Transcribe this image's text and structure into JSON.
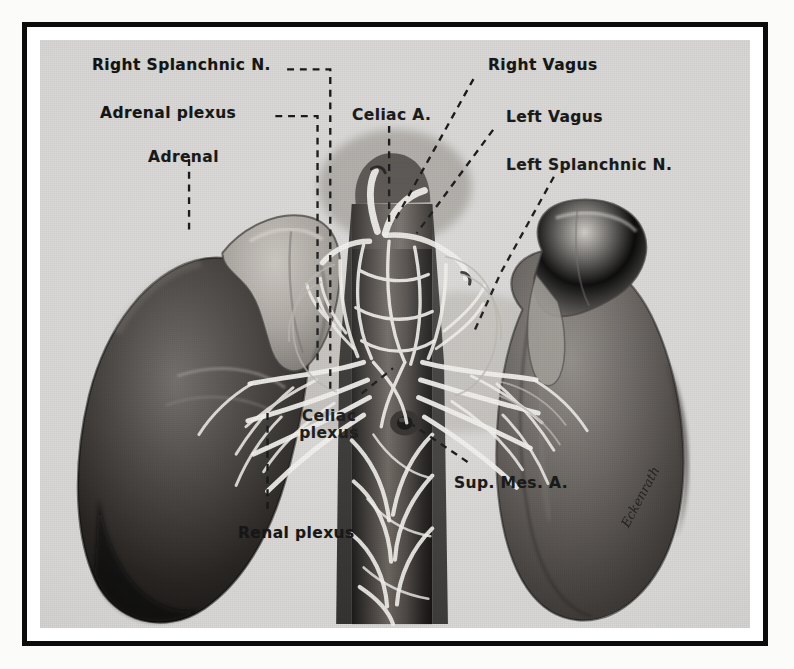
{
  "plate": {
    "kind": "anatomical-illustration",
    "subject": "Autonomic nerve supply of the kidneys and adrenal glands",
    "style": "black-and-white halftone photographic plate with dashed leader lines",
    "background_color": "#d9d8d6",
    "frame_color": "#0c0c0c",
    "label_color": "#111111",
    "leader_style": "dashed",
    "signature": {
      "text": "Eckenrath",
      "note": "artist's cursive signature along lower-right kidney margin",
      "legible": false
    }
  },
  "labels": [
    {
      "id": "right-splanchnic-n",
      "text": "Right Splanchnic N.",
      "side": "left",
      "leader": "horizontal-then-vertical"
    },
    {
      "id": "adrenal-plexus",
      "text": "Adrenal plexus",
      "side": "left",
      "leader": "horizontal-then-vertical"
    },
    {
      "id": "adrenal",
      "text": "Adrenal",
      "side": "left",
      "leader": "vertical"
    },
    {
      "id": "celiac-a",
      "text": "Celiac A.",
      "side": "center",
      "leader": "vertical"
    },
    {
      "id": "right-vagus",
      "text": "Right Vagus",
      "side": "right",
      "leader": "diagonal"
    },
    {
      "id": "left-vagus",
      "text": "Left Vagus",
      "side": "right",
      "leader": "diagonal"
    },
    {
      "id": "left-splanchnic-n",
      "text": "Left Splanchnic N.",
      "side": "right",
      "leader": "diagonal"
    },
    {
      "id": "celiac-plexus",
      "text": "Celiac plexus",
      "line1": "Celiac",
      "line2": "plexus",
      "side": "center",
      "leader": "diagonal"
    },
    {
      "id": "renal-plexus",
      "text": "Renal plexus",
      "side": "center",
      "leader": "vertical"
    },
    {
      "id": "sup-mes-a",
      "text": "Sup. Mes. A.",
      "side": "center",
      "leader": "diagonal"
    }
  ],
  "structures": [
    {
      "id": "left-kidney",
      "name": "Left kidney (viewer's left)",
      "tone": "dark"
    },
    {
      "id": "right-kidney",
      "name": "Right kidney (viewer's right)",
      "tone": "medium"
    },
    {
      "id": "left-adrenal",
      "name": "Left adrenal gland",
      "tone": "light"
    },
    {
      "id": "right-adrenal",
      "name": "Right adrenal gland",
      "tone": "light"
    },
    {
      "id": "aorta",
      "name": "Abdominal aorta",
      "tone": "dark-column"
    },
    {
      "id": "celiac-artery",
      "name": "Celiac artery",
      "tone": "light"
    },
    {
      "id": "sup-mes-artery",
      "name": "Superior mesenteric artery",
      "tone": "dark-ostium"
    },
    {
      "id": "nerve-plexus",
      "name": "Autonomic nerve plexus fibers",
      "tone": "white-strands"
    }
  ]
}
